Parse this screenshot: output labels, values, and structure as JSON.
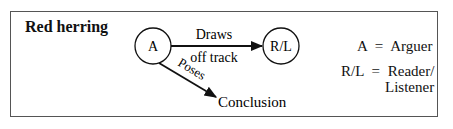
{
  "title": "Red herring",
  "nodes": {
    "arguer": {
      "label": "A"
    },
    "reader": {
      "label": "R/L"
    },
    "conclusion": {
      "label": "Conclusion"
    }
  },
  "edges": {
    "draws": {
      "label_line1": "Draws",
      "label_line2": "off track"
    },
    "poses": {
      "label": "Poses"
    }
  },
  "legend": {
    "a_key": "A",
    "a_eq": "=",
    "a_value": "Arguer",
    "rl_key": "R/L",
    "rl_eq": "=",
    "rl_value_line1": "Reader/",
    "rl_value_line2": "Listener"
  },
  "colors": {
    "ink": "#111111",
    "border": "#555555",
    "background": "#ffffff"
  }
}
